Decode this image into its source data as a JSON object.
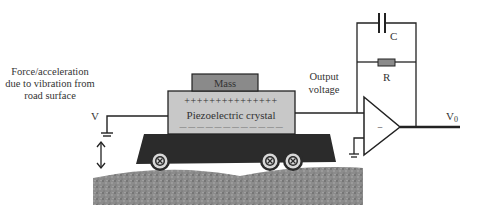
{
  "diagram": {
    "labels": {
      "force_line1": "Force/acceleration",
      "force_line2": "due to vibration from",
      "force_line3": "road surface",
      "input_voltage": "V",
      "mass": "Mass",
      "positive_charges": "+++++++++++++++",
      "crystal": "Piezoelectric crystal",
      "negative_charges": "— — — — — — — — — — — —",
      "output_line1": "Output",
      "output_line2": "voltage",
      "capacitor": "C",
      "resistor": "R",
      "opamp_sign": "−",
      "output_voltage": "V",
      "output_subscript": "0"
    },
    "colors": {
      "vehicle": "#2b2b2b",
      "crystal": "#c8c8c8",
      "mass": "#8a8a8a",
      "road": "#8c8c8c",
      "resistor": "#8a8a8a",
      "wire": "#222222",
      "text": "#333333"
    }
  }
}
